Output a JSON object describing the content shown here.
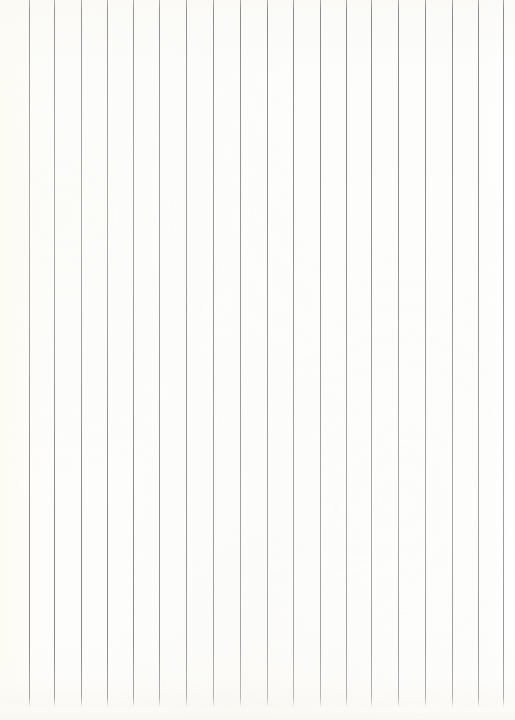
{
  "document": {
    "kind": "ruled-paper-sheet",
    "description": "Blank sheet of ruled notebook paper, scanned and rotated 90 degrees so the rules run vertically",
    "orientation": "rotated-90-vertical-rules",
    "visible_text": "",
    "has_handwriting": false,
    "has_printed_text": false
  },
  "canvas": {
    "width": 515,
    "height": 720
  },
  "paper": {
    "base_color": "#fdfdfc",
    "left_edge_color": "#fdfcf3",
    "right_edge_color": "#ffffff",
    "bottom_shade_color": "#f6f4ee",
    "top_shade_color": "#f8f7f3"
  },
  "rules": {
    "color": "#8a8a8a",
    "color_soft": "#a9a9a9",
    "thickness_px": 1,
    "count": 19,
    "spacing_px": 26.35,
    "start_y": 0,
    "end_y": 713,
    "x_positions": [
      29,
      54,
      81,
      107,
      133,
      159,
      186,
      213,
      240,
      267,
      293,
      320,
      346,
      371,
      398,
      425,
      452,
      478,
      503
    ]
  },
  "margins": {
    "left_blank_px": 29,
    "right_blank_px": 12,
    "bottom_blank_px": 7
  }
}
